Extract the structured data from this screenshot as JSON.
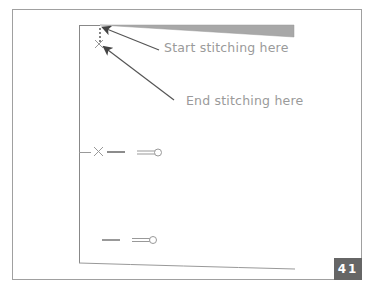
{
  "diagram": {
    "annotations": [
      {
        "id": "start",
        "text": "Start stitching here"
      },
      {
        "id": "end",
        "text": "End stitching here"
      }
    ],
    "page_number": "41",
    "colors": {
      "frame": "#999999",
      "page_edge": "#888888",
      "fabric_fold": "#a8a8a8",
      "arrow": "#555555",
      "label_text": "#9a9a9a",
      "page_number_bg": "#666666",
      "page_number_text": "#ffffff"
    },
    "markers": [
      {
        "type": "stitch-x",
        "label": "start/end point"
      },
      {
        "type": "stitch-x-with-pin",
        "label": "side marker"
      },
      {
        "type": "pin",
        "label": "lower marker"
      }
    ]
  }
}
